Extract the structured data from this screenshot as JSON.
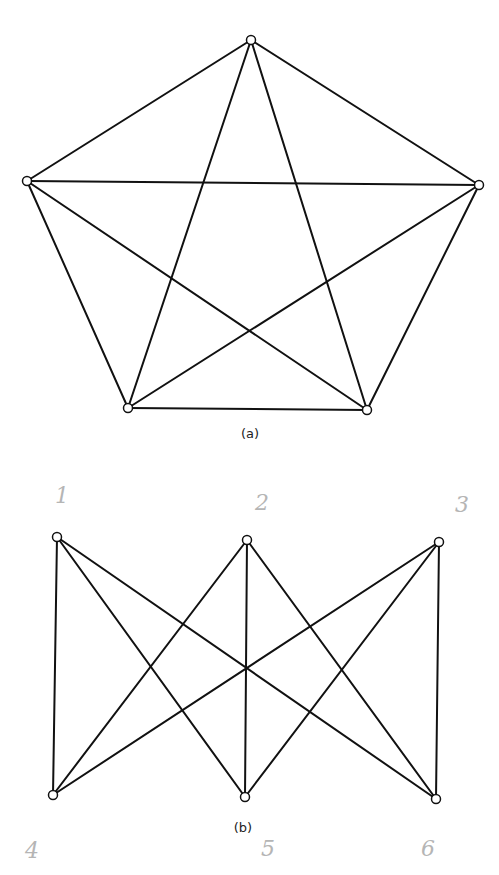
{
  "diagrams": [
    {
      "id": "a",
      "caption": "(a)",
      "caption_pos": [
        250,
        438
      ],
      "type": "complete-graph-K5",
      "vertices": [
        {
          "x": 251,
          "y": 40
        },
        {
          "x": 479,
          "y": 185
        },
        {
          "x": 367,
          "y": 410
        },
        {
          "x": 128,
          "y": 408
        },
        {
          "x": 27,
          "y": 181
        }
      ],
      "edges": [
        [
          0,
          1
        ],
        [
          0,
          2
        ],
        [
          0,
          3
        ],
        [
          0,
          4
        ],
        [
          1,
          2
        ],
        [
          1,
          3
        ],
        [
          1,
          4
        ],
        [
          2,
          3
        ],
        [
          2,
          4
        ],
        [
          3,
          4
        ]
      ]
    },
    {
      "id": "b",
      "caption": "(b)",
      "caption_pos": [
        243,
        832
      ],
      "type": "complete-bipartite-K33",
      "vertices": [
        {
          "x": 57,
          "y": 537,
          "label": "1",
          "label_pos": [
            62,
            503
          ]
        },
        {
          "x": 247,
          "y": 540,
          "label": "2",
          "label_pos": [
            262,
            510
          ]
        },
        {
          "x": 439,
          "y": 542,
          "label": "3",
          "label_pos": [
            462,
            512
          ]
        },
        {
          "x": 53,
          "y": 795,
          "label": "4",
          "label_pos": [
            32,
            858
          ]
        },
        {
          "x": 245,
          "y": 797,
          "label": "5",
          "label_pos": [
            268,
            856
          ]
        },
        {
          "x": 436,
          "y": 799,
          "label": "6",
          "label_pos": [
            428,
            856
          ]
        }
      ],
      "edges": [
        [
          0,
          3
        ],
        [
          0,
          4
        ],
        [
          0,
          5
        ],
        [
          1,
          3
        ],
        [
          1,
          4
        ],
        [
          1,
          5
        ],
        [
          2,
          3
        ],
        [
          2,
          4
        ],
        [
          2,
          5
        ]
      ]
    }
  ],
  "colors": {
    "stroke": "#111111",
    "handwriting": "#b5b5b5",
    "background": "#ffffff"
  }
}
